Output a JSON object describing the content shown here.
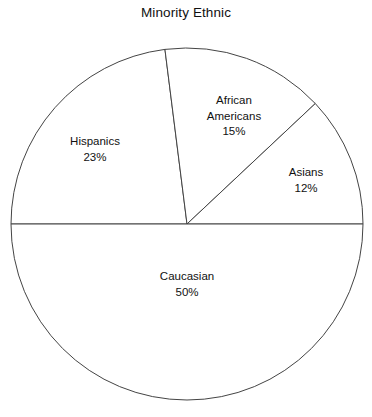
{
  "chart_data": {
    "type": "pie",
    "title": "Minority Ethnic",
    "xlabel": "",
    "ylabel": "",
    "legend": "none",
    "grid": false,
    "labels_inside": true,
    "categories": [
      "Hispanics",
      "African Americans",
      "Asians",
      "Caucasian"
    ],
    "values": [
      23,
      15,
      12,
      50
    ],
    "value_unit": "%",
    "value_labels": [
      "23%",
      "15%",
      "12%",
      "50%"
    ],
    "start_angle_deg": 180,
    "direction": "clockwise",
    "slices": [
      {
        "name": "Hispanics",
        "value": 23,
        "value_label": "23%",
        "label_line1": "Hispanics",
        "label_line2": "23%",
        "fill": "#ffffff",
        "stroke": "#444444"
      },
      {
        "name": "African Americans",
        "value": 15,
        "value_label": "15%",
        "label_line1": "African",
        "label_line2": "Americans",
        "label_line3": "15%",
        "fill": "#ffffff",
        "stroke": "#444444"
      },
      {
        "name": "Asians",
        "value": 12,
        "value_label": "12%",
        "label_line1": "Asians",
        "label_line2": "12%",
        "fill": "#ffffff",
        "stroke": "#444444"
      },
      {
        "name": "Caucasian",
        "value": 50,
        "value_label": "50%",
        "label_line1": "Caucasian",
        "label_line2": "50%",
        "fill": "#ffffff",
        "stroke": "#444444"
      }
    ],
    "total": 100,
    "background": "#ffffff"
  },
  "geometry": {
    "center_x": 187,
    "center_y": 224,
    "radius": 176
  }
}
